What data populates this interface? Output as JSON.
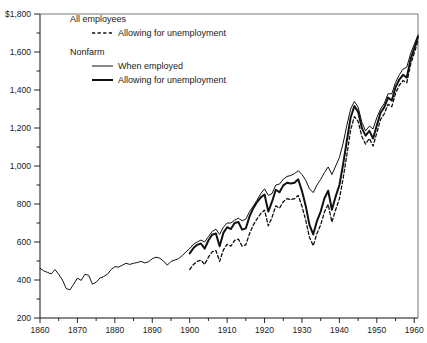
{
  "chart_data": {
    "type": "line",
    "title": "",
    "subtitle": "",
    "xlabel": "",
    "ylabel": "",
    "currency_prefix": "$",
    "xlim": [
      1860,
      1961
    ],
    "ylim": [
      200,
      1800
    ],
    "grid": false,
    "legend_position": "top-left-inside",
    "y_major_step": 200,
    "y_minor_step": 100,
    "x_major_step": 10,
    "x_minor_step": 5,
    "ytick_labels": [
      "200",
      "400",
      "600",
      "800",
      "1,000",
      "1,200",
      "1,400",
      "1,600",
      "$1,800"
    ],
    "ytick_values": [
      200,
      400,
      600,
      800,
      1000,
      1200,
      1400,
      1600,
      1800
    ],
    "xtick_labels": [
      "1860",
      "1870",
      "1880",
      "1890",
      "1900",
      "1910",
      "1920",
      "1930",
      "1940",
      "1950",
      "1960"
    ],
    "xtick_values": [
      1860,
      1870,
      1880,
      1890,
      1900,
      1910,
      1920,
      1930,
      1940,
      1950,
      1960
    ],
    "legend": [
      {
        "group": "All employees",
        "entries": [
          {
            "label": "Allowing for unemployment",
            "style": "dashed",
            "width": 1.3
          }
        ]
      },
      {
        "group": "Nonfarm",
        "entries": [
          {
            "label": "When employed",
            "style": "solid",
            "width": 1.0
          },
          {
            "label": "Allowing for unemployment",
            "style": "solid",
            "width": 2.0
          }
        ]
      }
    ],
    "series": [
      {
        "name": "Nonfarm, when employed",
        "key": "nonfarm_when_employed",
        "style": "solid",
        "width": 1.0,
        "x": [
          1860,
          1861,
          1862,
          1863,
          1864,
          1865,
          1866,
          1867,
          1868,
          1869,
          1870,
          1871,
          1872,
          1873,
          1874,
          1875,
          1876,
          1877,
          1878,
          1879,
          1880,
          1881,
          1882,
          1883,
          1884,
          1885,
          1886,
          1887,
          1888,
          1889,
          1890,
          1891,
          1892,
          1893,
          1894,
          1895,
          1896,
          1897,
          1898,
          1899,
          1900,
          1901,
          1902,
          1903,
          1904,
          1905,
          1906,
          1907,
          1908,
          1909,
          1910,
          1911,
          1912,
          1913,
          1914,
          1915,
          1916,
          1917,
          1918,
          1919,
          1920,
          1921,
          1922,
          1923,
          1924,
          1925,
          1926,
          1927,
          1928,
          1929,
          1930,
          1931,
          1932,
          1933,
          1934,
          1935,
          1936,
          1937,
          1938,
          1939,
          1940,
          1941,
          1942,
          1943,
          1944,
          1945,
          1946,
          1947,
          1948,
          1949,
          1950,
          1951,
          1952,
          1953,
          1954,
          1955,
          1956,
          1957,
          1958,
          1959,
          1960,
          1961
        ],
        "y": [
          462,
          448,
          440,
          432,
          455,
          430,
          400,
          355,
          348,
          378,
          410,
          398,
          430,
          425,
          378,
          388,
          410,
          418,
          430,
          455,
          470,
          468,
          478,
          488,
          482,
          488,
          492,
          498,
          490,
          496,
          512,
          520,
          515,
          500,
          478,
          498,
          505,
          512,
          528,
          548,
          565,
          588,
          600,
          610,
          600,
          628,
          655,
          668,
          640,
          678,
          700,
          700,
          715,
          725,
          712,
          720,
          760,
          790,
          820,
          855,
          880,
          845,
          855,
          900,
          905,
          930,
          945,
          950,
          960,
          975,
          955,
          925,
          880,
          860,
          900,
          930,
          965,
          995,
          955,
          1000,
          1045,
          1120,
          1215,
          1300,
          1340,
          1310,
          1230,
          1185,
          1210,
          1195,
          1255,
          1300,
          1330,
          1380,
          1380,
          1440,
          1480,
          1510,
          1520,
          1590,
          1640,
          1690
        ]
      },
      {
        "name": "Nonfarm, allowing for unemployment",
        "key": "nonfarm_allowing_unemployment",
        "style": "solid",
        "width": 2.0,
        "x": [
          1900,
          1901,
          1902,
          1903,
          1904,
          1905,
          1906,
          1907,
          1908,
          1909,
          1910,
          1911,
          1912,
          1913,
          1914,
          1915,
          1916,
          1917,
          1918,
          1919,
          1920,
          1921,
          1922,
          1923,
          1924,
          1925,
          1926,
          1927,
          1928,
          1929,
          1930,
          1931,
          1932,
          1933,
          1934,
          1935,
          1936,
          1937,
          1938,
          1939,
          1940,
          1941,
          1942,
          1943,
          1944,
          1945,
          1946,
          1947,
          1948,
          1949,
          1950,
          1951,
          1952,
          1953,
          1954,
          1955,
          1956,
          1957,
          1958,
          1959,
          1960,
          1961
        ],
        "y": [
          540,
          568,
          585,
          592,
          565,
          608,
          638,
          645,
          578,
          648,
          678,
          668,
          700,
          705,
          665,
          672,
          735,
          778,
          810,
          835,
          850,
          760,
          812,
          875,
          862,
          898,
          912,
          908,
          912,
          930,
          868,
          790,
          690,
          640,
          710,
          760,
          830,
          870,
          770,
          840,
          900,
          1010,
          1135,
          1255,
          1315,
          1285,
          1200,
          1160,
          1185,
          1145,
          1215,
          1280,
          1310,
          1360,
          1345,
          1415,
          1455,
          1480,
          1465,
          1560,
          1620,
          1680
        ]
      },
      {
        "name": "All employees, allowing for unemployment",
        "key": "all_employees_allowing_unemployment",
        "style": "dashed",
        "width": 1.3,
        "x": [
          1900,
          1901,
          1902,
          1903,
          1904,
          1905,
          1906,
          1907,
          1908,
          1909,
          1910,
          1911,
          1912,
          1913,
          1914,
          1915,
          1916,
          1917,
          1918,
          1919,
          1920,
          1921,
          1922,
          1923,
          1924,
          1925,
          1926,
          1927,
          1928,
          1929,
          1930,
          1931,
          1932,
          1933,
          1934,
          1935,
          1936,
          1937,
          1938,
          1939,
          1940,
          1941,
          1942,
          1943,
          1944,
          1945,
          1946,
          1947,
          1948,
          1949,
          1950,
          1951,
          1952,
          1953,
          1954,
          1955,
          1956,
          1957,
          1958,
          1959,
          1960,
          1961
        ],
        "y": [
          455,
          482,
          498,
          505,
          482,
          520,
          548,
          555,
          498,
          558,
          588,
          578,
          608,
          615,
          578,
          585,
          645,
          690,
          722,
          750,
          768,
          685,
          730,
          790,
          778,
          812,
          828,
          822,
          828,
          845,
          788,
          715,
          625,
          580,
          645,
          690,
          758,
          798,
          705,
          770,
          828,
          935,
          1060,
          1190,
          1260,
          1235,
          1155,
          1115,
          1145,
          1105,
          1175,
          1245,
          1275,
          1325,
          1312,
          1382,
          1425,
          1450,
          1438,
          1532,
          1595,
          1658
        ]
      }
    ],
    "annotations": {
      "ww2_peak_year": 1944,
      "ww2_peak_value": 1340,
      "depression_trough_year": 1933,
      "depression_trough_value": 640,
      "civil_war_start_value": 462,
      "end_value": 1690
    }
  }
}
